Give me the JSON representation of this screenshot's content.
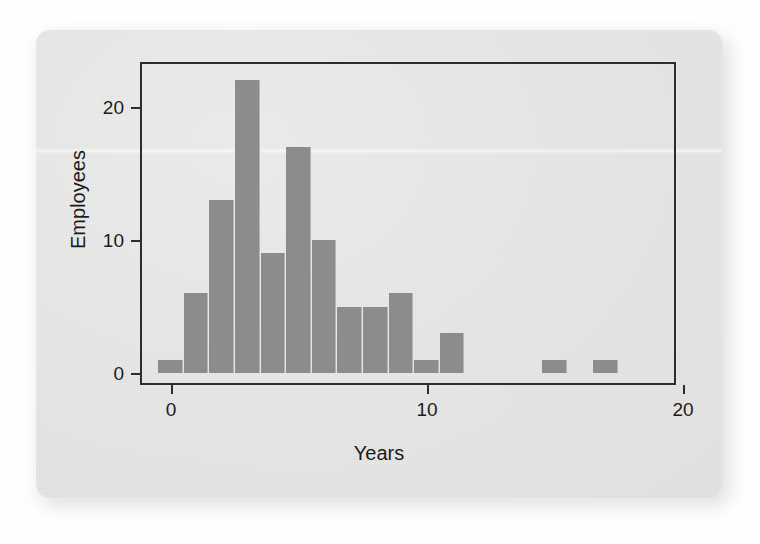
{
  "figure": {
    "background_color": "#e4e4e2",
    "bar_color": "#8c8c8c",
    "axis_color": "#2d2d2d"
  },
  "chart_data": {
    "type": "bar",
    "title": "",
    "subtitle": "",
    "xlabel": "Years",
    "ylabel": "Employees",
    "xlim": [
      -1,
      20.5
    ],
    "ylim": [
      0,
      24
    ],
    "xticks": [
      0,
      10,
      20
    ],
    "xtick_labels": [
      "0",
      "10",
      "20"
    ],
    "yticks": [
      0,
      10,
      20
    ],
    "ytick_labels": [
      "0",
      "10",
      "20"
    ],
    "grid": false,
    "legend": false,
    "bin_width": 1,
    "bin_starts": [
      -0.5,
      0.5,
      1.5,
      2.5,
      3.5,
      4.5,
      5.5,
      6.5,
      7.5,
      8.5,
      9.5,
      10.5,
      11.5,
      12.5,
      13.5,
      14.5,
      15.5,
      16.5
    ],
    "categories": [
      "0",
      "1",
      "2",
      "3",
      "4",
      "5",
      "6",
      "7",
      "8",
      "9",
      "10",
      "11",
      "12",
      "13",
      "14",
      "15",
      "16",
      "17"
    ],
    "values": [
      1,
      6,
      13,
      22,
      9,
      17,
      10,
      5,
      5,
      6,
      1,
      3,
      0,
      0,
      0,
      1,
      0,
      1
    ],
    "total_count": 95,
    "annotations": []
  }
}
